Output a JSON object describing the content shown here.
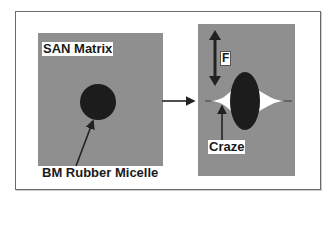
{
  "diagram": {
    "left_panel": {
      "title": "SAN Matrix",
      "particle_label": "BM Rubber Micelle"
    },
    "right_panel": {
      "force_label": "F",
      "craze_label": "Craze"
    },
    "transition_arrow": "right-arrow",
    "colors": {
      "matrix": "#8f8f8f",
      "particle": "#1c1c1c",
      "craze": "#ffffff",
      "frame": "#6a6a6a",
      "arrow": "#222222"
    }
  }
}
